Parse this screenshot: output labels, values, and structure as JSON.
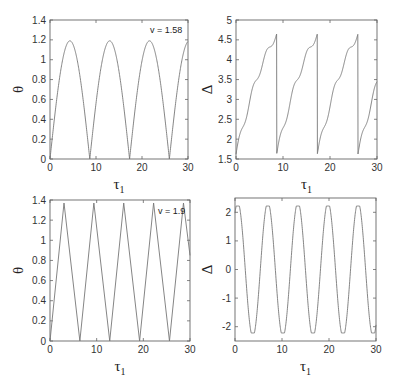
{
  "chart_data": [
    {
      "id": "top-left",
      "type": "line",
      "title": "",
      "xlabel": "τ1",
      "ylabel": "θ",
      "xlim": [
        0,
        30
      ],
      "ylim": [
        0,
        1.4
      ],
      "xticks": [
        0,
        10,
        20,
        30
      ],
      "yticks": [
        0,
        0.2,
        0.4,
        0.6,
        0.8,
        1,
        1.2,
        1.4
      ],
      "annotation": "v = 1.58",
      "grid": false,
      "frame": {
        "x0": 50,
        "x1": 188,
        "y0": 20,
        "y1": 159
      },
      "series": [
        {
          "name": "theta",
          "shape": "arch",
          "period": 8.65,
          "amplitude": 1.19,
          "phase": 0,
          "x": [
            0,
            4.3,
            8.65,
            12.95,
            17.3,
            21.6,
            26.0,
            30
          ],
          "y": [
            0,
            1.19,
            0,
            1.19,
            0,
            1.19,
            0,
            1.17
          ]
        }
      ]
    },
    {
      "id": "top-right",
      "type": "line",
      "title": "",
      "xlabel": "τ1",
      "ylabel": "Δ",
      "xlim": [
        0,
        30
      ],
      "ylim": [
        1.5,
        5
      ],
      "xticks": [
        0,
        10,
        20,
        30
      ],
      "yticks": [
        1.5,
        2,
        2.5,
        3,
        3.5,
        4,
        4.5,
        5
      ],
      "grid": false,
      "frame": {
        "x0": 236,
        "x1": 377,
        "y0": 20,
        "y1": 159
      },
      "series": [
        {
          "name": "delta",
          "shape": "sawtooth",
          "period": 8.65,
          "min": 1.62,
          "max": 4.65,
          "x": [
            0,
            1.5,
            3.5,
            5.5,
            7.5,
            8.6,
            8.65,
            10.1,
            12.1,
            14.1,
            16.1,
            17.25,
            17.3,
            18.8,
            20.8,
            22.8,
            24.8,
            25.95,
            26.0,
            27.5,
            30
          ],
          "y": [
            1.62,
            2.55,
            2.95,
            3.55,
            3.95,
            4.65,
            1.62,
            2.55,
            2.95,
            3.55,
            3.95,
            4.65,
            1.62,
            2.55,
            2.95,
            3.55,
            3.95,
            4.65,
            1.62,
            2.55,
            2.95
          ]
        }
      ]
    },
    {
      "id": "bottom-left",
      "type": "line",
      "title": "",
      "xlabel": "τ1",
      "ylabel": "θ",
      "xlim": [
        0,
        30
      ],
      "ylim": [
        0,
        1.4
      ],
      "xticks": [
        0,
        10,
        20,
        30
      ],
      "yticks": [
        0,
        0.2,
        0.4,
        0.6,
        0.8,
        1,
        1.2,
        1.4
      ],
      "annotation": "v = 1.9",
      "grid": false,
      "frame": {
        "x0": 50,
        "x1": 190,
        "y0": 200,
        "y1": 341
      },
      "series": [
        {
          "name": "theta",
          "shape": "triangle",
          "period": 6.4,
          "amplitude": 1.37,
          "x": [
            0,
            3.0,
            6.4,
            9.4,
            12.8,
            15.8,
            19.2,
            22.2,
            25.6,
            28.6,
            30
          ],
          "y": [
            0,
            1.37,
            0,
            1.37,
            0,
            1.37,
            0,
            1.37,
            0,
            1.37,
            0.85
          ]
        }
      ]
    },
    {
      "id": "bottom-right",
      "type": "line",
      "title": "",
      "xlabel": "τ1",
      "ylabel": "Δ",
      "xlim": [
        0,
        30
      ],
      "ylim": [
        -2.5,
        2.5
      ],
      "xticks": [
        0,
        10,
        20,
        30
      ],
      "yticks": [
        -2,
        -1,
        0,
        1,
        2
      ],
      "grid": false,
      "frame": {
        "x0": 235,
        "x1": 376,
        "y0": 198,
        "y1": 341
      },
      "series": [
        {
          "name": "delta",
          "shape": "oscillation-with-jumps",
          "period": 6.4,
          "max": 2.22,
          "min": -2.22,
          "x": [
            0,
            1.2,
            2.2,
            3.2,
            4.8,
            6.1,
            6.15,
            7.6,
            8.6,
            9.6,
            11.2,
            12.5,
            12.55,
            14.0,
            15.0,
            16.0,
            17.6,
            18.9,
            18.95,
            20.4,
            21.4,
            22.4,
            24.0,
            25.3,
            25.35,
            26.8,
            27.8,
            28.8,
            30
          ],
          "y": [
            1.6,
            2.22,
            1.2,
            -1.2,
            -2.22,
            -1.7,
            1.5,
            2.22,
            1.2,
            -1.2,
            -2.22,
            -1.7,
            1.5,
            2.22,
            1.2,
            -1.2,
            -2.22,
            -1.7,
            1.5,
            2.22,
            1.2,
            -1.2,
            -2.22,
            -1.7,
            1.5,
            2.22,
            1.2,
            -1.2,
            -2.3
          ]
        }
      ]
    }
  ],
  "labels": {
    "x_axis": "τ",
    "x_axis_sub": "1",
    "theta": "θ",
    "delta": "Δ",
    "annot_tl": "v = 1.58",
    "annot_bl": "v = 1.9"
  }
}
